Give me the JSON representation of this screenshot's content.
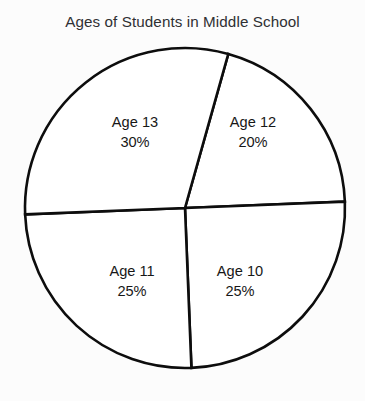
{
  "chart_data": {
    "type": "pie",
    "title": "Ages of Students in Middle School",
    "xlabel": "",
    "ylabel": "",
    "legend": "none",
    "grid": false,
    "value_unit": "%",
    "categories": [
      "Age 12",
      "Age 10",
      "Age 11",
      "Age 13"
    ],
    "values": [
      20,
      25,
      25,
      30
    ],
    "slices": [
      {
        "name": "Age 12",
        "label": "Age 12",
        "value": 20,
        "value_label": "20%",
        "fill": "#ffffff",
        "start_angle": 15.7,
        "end_angle": 87.7,
        "label_x": 253,
        "label_y": 122
      },
      {
        "name": "Age 10",
        "label": "Age 10",
        "value": 25,
        "value_label": "25%",
        "fill": "#ffffff",
        "start_angle": 87.7,
        "end_angle": 177.7,
        "label_x": 240,
        "label_y": 271
      },
      {
        "name": "Age 11",
        "label": "Age 11",
        "value": 25,
        "value_label": "25%",
        "fill": "#ffffff",
        "start_angle": 177.7,
        "end_angle": 267.7,
        "label_x": 132,
        "label_y": 271
      },
      {
        "name": "Age 13",
        "label": "Age 13",
        "value": 30,
        "value_label": "30%",
        "fill": "#ffffff",
        "start_angle": 267.7,
        "end_angle": 375.7,
        "label_x": 135,
        "label_y": 122
      }
    ],
    "geometry": {
      "center_x": 185,
      "center_y": 208,
      "radius": 160,
      "stroke_color": "#0d0d0d",
      "stroke_width": 2.6
    },
    "title_color": "#2f3033",
    "label_color": "#171717",
    "background": "#fcfcfc"
  }
}
